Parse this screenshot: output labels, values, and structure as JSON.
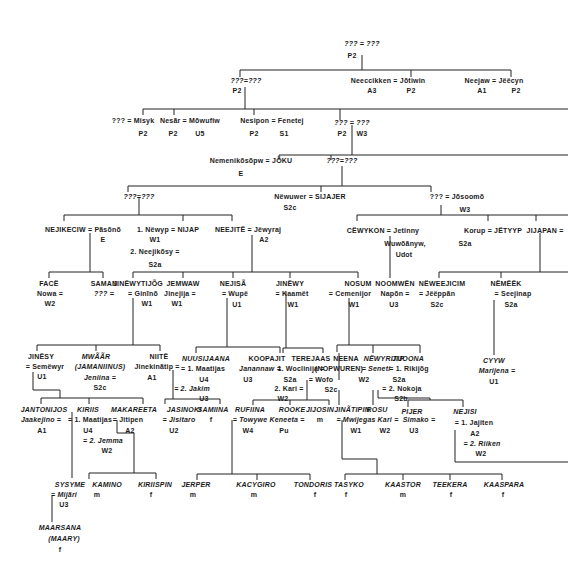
{
  "diagram_type": "genealogy-kinship-chart",
  "gen1": {
    "root_couple": "??? = ???",
    "root_code": "P2"
  },
  "gen2": {
    "left_couple": "???=???",
    "left_code": "P2",
    "mid_couple": "Neeccikken = Jõtiwin",
    "mid_code_a": "A3",
    "mid_code_b": "P2",
    "right_couple": "Neejaw = Jëëcyn",
    "right_code_a": "A1",
    "right_code_b": "P2"
  },
  "gen3": {
    "a_couple": "??? = Misyk",
    "a_code": "P2",
    "b_couple": "Nesãr = Mõwufiw",
    "b_code_a": "P2",
    "b_code_b": "U5",
    "c_couple": "Nesipon = Fenetej",
    "c_code_a": "P2",
    "c_code_b": "S1",
    "d_couple": "??? = ???",
    "d_code_a": "P2",
    "d_code_b": "W3"
  },
  "gen4": {
    "a_couple": "Nemenikõsõpw = JÕKU",
    "a_code": "E",
    "b_couple": "???=???"
  },
  "gen5": {
    "a_couple": "???=???",
    "b_couple": "Nëwuwer = SIJAJER",
    "b_code": "S2c",
    "c_couple": "??? = Jõsoomõ",
    "c_code": "W3"
  },
  "gen6": {
    "nejikeciw": "NEJIKECIW = Pãsõnõ",
    "nejikeciw_code": "E",
    "newyp": "1. Nëwyp = NIJAP",
    "newyp_code": "W1",
    "neejikosy": "2. Neejikõsy =",
    "neejikosy_code": "S2a",
    "neejite": "NEEJITË = Jëwyraj",
    "neejite_code": "A2",
    "cewykon": "CËWYKON = Jetinny",
    "cewykon_spouse2": "Wuwõãnyw,",
    "cewykon_spouse3": "Udot",
    "korup": "Korup = JËTYYP",
    "korup_code": "S2a",
    "jijapan": "JIJAPAN ="
  },
  "gen7": {
    "face_name": "FACË",
    "face_spouse": "Nowa =",
    "face_code": "W2",
    "saman_name": "SAMAN",
    "saman_spouse": "??? =",
    "jinewytijog_name": "JINËWYTIJÕG",
    "jinewytijog_spouse": "= Ginĩnõ",
    "jinewytijog_code": "W1",
    "jemwaw_name": "JEMWAW",
    "jemwaw_spouse": "Jinejija =",
    "jemwaw_code": "W1",
    "nejisa_name": "NEJISÃ",
    "nejisa_spouse": "= Wupë",
    "nejisa_code": "U1",
    "jinewy_name": "JINËWY",
    "jinewy_spouse": "= Kaamët",
    "jinewy_code": "W1",
    "nosum_name": "NOSUM",
    "nosum_spouse": "= Cemenijor",
    "nosum_code": "W1",
    "noomwen_name": "NOOMWËN",
    "noomwen_spouse": "Napõn =",
    "noomwen_code": "U3",
    "neweejicim_name": "NËWEEJICIM",
    "neweejicim_spouse": "= Jëëppãn",
    "neweejicim_code": "S2c",
    "nemeek_name": "NËMËËK",
    "nemeek_spouse": "= Seejinap",
    "nemeek_code": "S2a"
  },
  "gen8": {
    "jinesy_name": "JINËSY",
    "jinesy_spouse": "= Semëwyr",
    "jinesy_code": "U1",
    "mwaar_name": "MWÃÃR",
    "mwaar_alias": "(JAMANIINUS)",
    "mwaar_spouse": "Jeniina =",
    "mwaar_code": "S2c",
    "niite_name": "NIITË",
    "niite_spouse": "Jinekinãtip =",
    "niite_code": "A1",
    "nuusijaana_name": "NUUSIJAANA",
    "nuusijaana_sp1": "= 1. Maatijas",
    "nuusijaana_code1": "U4",
    "nuusijaana_sp2": "= 2. Jakim",
    "nuusijaana_code2": "U3",
    "koopajit_name": "KOOPAJIT",
    "koopajit_spouse": "Janannaw =",
    "koopajit_code": "U3",
    "terejaas_name": "TEREJAAS",
    "terejaas_sp1": "1. Woclinija =",
    "terejaas_code1": "S2a",
    "terejaas_sp2": "2. Kari =",
    "terejaas_code2": "W2",
    "neena_name": "NEENA",
    "neena_alias": "(NOPWUREN)",
    "neena_spouse": "= Wofo",
    "neena_code": "S2c",
    "newyritip_name": "NËWYRITIP",
    "newyritip_spouse": "= Seneti",
    "newyritip_code": "W2",
    "jijoona_name": "JIJOONA",
    "jijoona_sp1": "= 1. Rikijõg",
    "jijoona_code1": "S2a",
    "jijoona_sp2": "= 2. Nokoja",
    "jijoona_code2": "S2b",
    "cyyw_name": "CYYW",
    "cyyw_spouse": "Marijena =",
    "cyyw_code": "U1"
  },
  "gen9": {
    "jantonijos_name": "JANTONIJOS",
    "jantonijos_spouse": "Jaakejino =",
    "jantonijos_code": "A1",
    "kiriis_name": "KIRIIS",
    "kiriis_sp1": "= 1. Maatijas",
    "kiriis_code1": "U4",
    "kiriis_sp2": "= 2. Jemma",
    "kiriis_code2": "W2",
    "makareeta_name": "MAKAREETA",
    "makareeta_spouse": "= Jitipen",
    "makareeta_code": "A2",
    "jasinoki_name": "JASINOKI",
    "jasinoki_spouse": "= Jisitaro",
    "jasinoki_code": "U2",
    "samiina_name": "SAMIINA",
    "samiina_sex": "f",
    "rufiina_name": "RUFIINA",
    "rufiina_spouse": "= Towywe",
    "rufiina_code": "W4",
    "rooke_name": "ROOKE",
    "rooke_spouse": "Keneeta =",
    "rooke_code": "Pu",
    "jijosin_name": "JIJOSIN",
    "jijosin_sex": "m",
    "jinatipin_name": "JINÃTIPIN",
    "jinatipin_spouse": "= Mwijegas",
    "jinatipin_code": "W1",
    "rosu_name": "ROSU",
    "rosu_spouse": "Kari =",
    "rosu_code": "W2",
    "pijer_name": "PIJER",
    "pijer_spouse": "Simako =",
    "pijer_code": "U3",
    "nejisi_name": "NEJISI",
    "nejisi_sp1": "= 1. Jajiten",
    "nejisi_code1": "A2",
    "nejisi_sp2": "= 2. Riiken",
    "nejisi_code2": "W2"
  },
  "gen10": {
    "sysyme_name": "SYSYME",
    "sysyme_spouse": "= Mijãri",
    "sysyme_code": "U3",
    "kamino_name": "KAMINO",
    "kamino_sex": "m",
    "kiriispin_name": "KIRIISPIN",
    "kiriispin_sex": "f",
    "jerper_name": "JERPER",
    "jerper_sex": "m",
    "kacygiro_name": "KACYGIRO",
    "kacygiro_sex": "m",
    "tondoris_name": "TONDORIS",
    "tondoris_sex": "f",
    "tasyko_name": "TASYKO",
    "tasyko_sex": "f",
    "kaastor_name": "KAASTOR",
    "kaastor_sex": "m",
    "teekera_name": "TEEKERA",
    "teekera_sex": "f",
    "kaaspara_name": "KAASPARA",
    "kaaspara_sex": "f"
  },
  "gen11": {
    "maarsana_name": "MAARSANA",
    "maarsana_alias": "(MAARY)",
    "maarsana_sex": "f"
  }
}
